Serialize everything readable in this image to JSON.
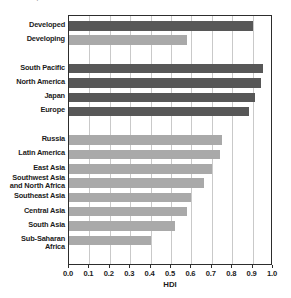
{
  "caption": {
    "text": "decades, and access to health care has"
  },
  "chart_data": {
    "type": "bar",
    "orientation": "horizontal",
    "title": "",
    "xlabel": "HDI",
    "ylabel": "",
    "xlim": [
      0.0,
      1.0
    ],
    "grid": true,
    "legend": "none",
    "tick_labels": [
      "0.0",
      "0.1",
      "0.2",
      "0.3",
      "0.4",
      "0.5",
      "0.6",
      "0.7",
      "0.8",
      "0.9",
      "1.0"
    ],
    "tick_values": [
      0.0,
      0.1,
      0.2,
      0.3,
      0.4,
      0.5,
      0.6,
      0.7,
      0.8,
      0.9,
      1.0
    ],
    "colors": {
      "dark": "#575757",
      "light": "#a9a9a9",
      "gridline": "#c9c9c9",
      "frame": "#2d2d2d"
    },
    "groups": [
      {
        "name": "overall",
        "items": [
          {
            "label": "Developed",
            "value": 0.9,
            "shade": "dark"
          },
          {
            "label": "Developing",
            "value": 0.58,
            "shade": "light"
          }
        ]
      },
      {
        "name": "developed-regions",
        "items": [
          {
            "label": "South Pacific",
            "value": 0.95,
            "shade": "dark"
          },
          {
            "label": "North America",
            "value": 0.94,
            "shade": "dark"
          },
          {
            "label": "Japan",
            "value": 0.91,
            "shade": "dark"
          },
          {
            "label": "Europe",
            "value": 0.88,
            "shade": "dark"
          }
        ]
      },
      {
        "name": "developing-regions",
        "items": [
          {
            "label": "Russia",
            "value": 0.75,
            "shade": "light"
          },
          {
            "label": "Latin America",
            "value": 0.74,
            "shade": "light"
          },
          {
            "label": "East Asia",
            "value": 0.7,
            "shade": "light"
          },
          {
            "label": "Southwest Asia\nand North Africa",
            "value": 0.66,
            "shade": "light"
          },
          {
            "label": "Southeast Asia",
            "value": 0.6,
            "shade": "light"
          },
          {
            "label": "Central Asia",
            "value": 0.58,
            "shade": "light"
          },
          {
            "label": "South Asia",
            "value": 0.52,
            "shade": "light"
          },
          {
            "label": "Sub-Saharan Africa",
            "value": 0.4,
            "shade": "light"
          }
        ]
      }
    ]
  }
}
